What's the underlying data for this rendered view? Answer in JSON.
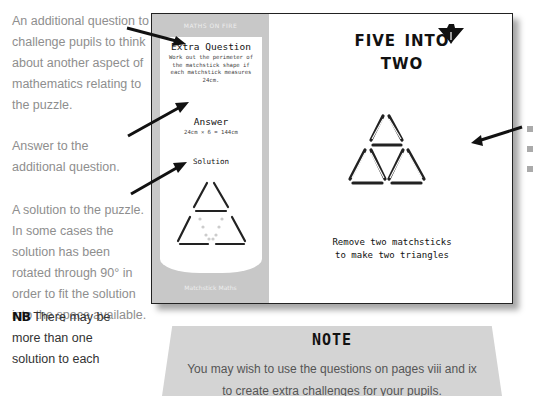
{
  "annotations": {
    "question": "An additional question to challenge pupils to think about another aspect of mathematics relating to the puzzle.",
    "answer": "Answer to the additional question.",
    "solution": "A solution to the puzzle. In some cases the solution has been rotated through 90° in order to fit the solution into the space available.",
    "nb_label": "NB",
    "nb_lines": [
      "There may be",
      "more than one",
      "solution to each"
    ]
  },
  "page": {
    "sidebar": {
      "header": "MATHS ON FIRE",
      "extra_question_title": "Extra Question",
      "extra_question_text": "Work out the perimeter of the matchstick shape if each matchstick measures 24cm.",
      "answer_title": "Answer",
      "answer_text": "24cm × 6 = 144cm",
      "solution_title": "Solution",
      "footer": "Matchstick Maths"
    },
    "title_line1": "Five into",
    "title_line2": "two",
    "logo_icon": "match-logo-icon",
    "instruction_line1": "Remove two matchsticks",
    "instruction_line2": "to make two triangles"
  },
  "note": {
    "title": "NOTE",
    "line1": "You may wish to use the questions on pages viii and ix",
    "line2": "to create extra challenges for your pupils."
  },
  "colors": {
    "sidebar": "#c8c8c8",
    "note_bg": "#d4d4d4",
    "annotation_text": "#8e8e8e",
    "ink": "#111111"
  }
}
